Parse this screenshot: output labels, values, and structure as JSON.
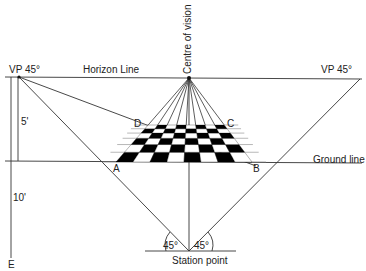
{
  "diagram": {
    "type": "perspective-construction",
    "labels": {
      "vp_left": "VP 45°",
      "vp_right": "VP 45°",
      "horizon": "Horizon Line",
      "centre_of_vision": "Centre of vision",
      "ground_line": "Ground line",
      "station_point": "Station point",
      "height_5": "5'",
      "height_10": "10'",
      "point_e": "E",
      "corner_a": "A",
      "corner_b": "B",
      "corner_c": "C",
      "corner_d": "D",
      "angle_left": "45°",
      "angle_right": "45°"
    },
    "colors": {
      "line": "#333333",
      "fill_dark": "#000000",
      "fill_light": "#ffffff"
    },
    "grid": {
      "rows": 6,
      "cols": 8
    }
  }
}
